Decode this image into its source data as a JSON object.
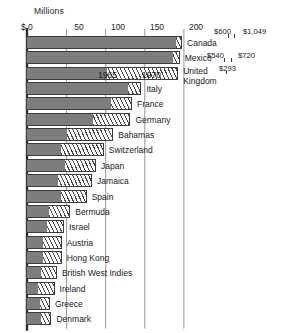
{
  "chart_data": {
    "type": "bar",
    "orientation": "horizontal",
    "title": "",
    "unit_label": "Millions",
    "xlabel": "",
    "ylabel": "",
    "xlim": [
      0,
      215
    ],
    "axis_prefix": "$",
    "grid": true,
    "legend_position": "inline-annotation",
    "tick_labels": [
      "$ 0",
      "50",
      "100",
      "150",
      "200"
    ],
    "tick_values": [
      0,
      50,
      100,
      150,
      200
    ],
    "series": [
      {
        "name": "1965",
        "style": "solid-gray"
      },
      {
        "name": "1970",
        "style": "diagonal-hatch"
      }
    ],
    "categories": [
      "Canada",
      "Mexico",
      "United Kingdom",
      "Italy",
      "France",
      "Germany",
      "Bahamas",
      "Switzerland",
      "Japan",
      "Jamaica",
      "Spain",
      "Bermuda",
      "Israel",
      "Austria",
      "Hong Kong",
      "British West Indies",
      "Ireland",
      "Greece",
      "Denmark"
    ],
    "rows": [
      {
        "label": "Canada",
        "v1965": 191,
        "v1970": 197,
        "label_lines": [
          "Canada"
        ]
      },
      {
        "label": "Mexico",
        "v1965": 187,
        "v1970": 194,
        "label_lines": [
          "Mexico"
        ]
      },
      {
        "label": "United Kingdom",
        "v1965": 102,
        "v1970": 192,
        "label_lines": [
          "United",
          "Kingdom"
        ]
      },
      {
        "label": "Italy",
        "v1965": 129,
        "v1970": 145,
        "label_lines": [
          "Italy"
        ]
      },
      {
        "label": "France",
        "v1965": 107,
        "v1970": 133,
        "label_lines": [
          "France"
        ]
      },
      {
        "label": "Germany",
        "v1965": 85,
        "v1970": 131,
        "label_lines": [
          "Germany"
        ]
      },
      {
        "label": "Bahamas",
        "v1965": 51,
        "v1970": 109,
        "label_lines": [
          "Bahamas"
        ]
      },
      {
        "label": "Switzerland",
        "v1965": 44,
        "v1970": 97,
        "label_lines": [
          "Switzerland"
        ]
      },
      {
        "label": "Japan",
        "v1965": 49,
        "v1970": 87,
        "label_lines": [
          "Japan"
        ]
      },
      {
        "label": "Jamaica",
        "v1965": 40,
        "v1970": 82,
        "label_lines": [
          "Jamaica"
        ]
      },
      {
        "label": "Spain",
        "v1965": 43,
        "v1970": 75,
        "label_lines": [
          "Spain"
        ]
      },
      {
        "label": "Bermuda",
        "v1965": 28,
        "v1970": 54,
        "label_lines": [
          "Bermuda"
        ]
      },
      {
        "label": "Israel",
        "v1965": 25,
        "v1970": 46,
        "label_lines": [
          "Israel"
        ]
      },
      {
        "label": "Austria",
        "v1965": 20,
        "v1970": 43,
        "label_lines": [
          "Austria"
        ]
      },
      {
        "label": "Hong Kong",
        "v1965": 20,
        "v1970": 43,
        "label_lines": [
          "Hong Kong"
        ]
      },
      {
        "label": "British West Indies",
        "v1965": 18,
        "v1970": 37,
        "label_lines": [
          "British West Indies"
        ]
      },
      {
        "label": "Ireland",
        "v1965": 14,
        "v1970": 34,
        "label_lines": [
          "Ireland"
        ]
      },
      {
        "label": "Greece",
        "v1965": 17,
        "v1970": 28,
        "label_lines": [
          "Greece"
        ]
      },
      {
        "label": "Denmark",
        "v1965": 18,
        "v1970": 30,
        "label_lines": [
          "Denmark"
        ]
      }
    ],
    "value_annotations": [
      {
        "text": "$600",
        "row": "Canada",
        "series": "1965"
      },
      {
        "text": "$1,049",
        "row": "Canada",
        "series": "1970"
      },
      {
        "text": "$540",
        "row": "Mexico",
        "series": "1965"
      },
      {
        "text": "$720",
        "row": "Mexico",
        "series": "1970"
      },
      {
        "text": "$293",
        "row": "United Kingdom",
        "series": "1970"
      }
    ],
    "segment_annotations": [
      {
        "text": "1965",
        "row": "United Kingdom"
      },
      {
        "text": "1970",
        "row": "United Kingdom"
      }
    ]
  },
  "colors": {
    "series_1965": "#7d7d7d",
    "series_1970_hatch": "#4a4a4a",
    "bar_outline": "#3d3d3d",
    "axis": "#2e2e2e",
    "grid": "#8a8a8a",
    "text": "#1a1a1a",
    "background": "#ffffff"
  }
}
